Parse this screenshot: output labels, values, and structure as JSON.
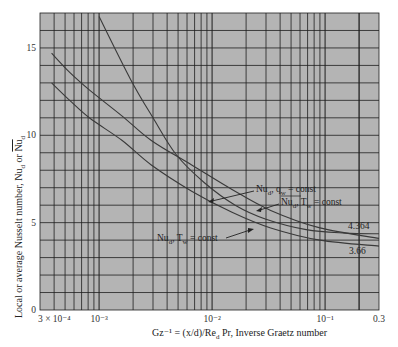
{
  "chart_data": {
    "type": "line",
    "title": "",
    "xlabel": "Gz⁻¹ = (x/d)/Re_d Pr, Inverse Graetz number",
    "ylabel": "Local or average Nusselt number, Nu_d or N̄u_d",
    "xscale": "log",
    "xlim": [
      0.0003,
      0.3
    ],
    "ylim": [
      0,
      17
    ],
    "grid": true,
    "x_tick_labels": [
      "3 × 10⁻⁴",
      "10⁻³",
      "10⁻²",
      "10⁻¹",
      "0.3"
    ],
    "x_ticks": [
      0.0003,
      0.001,
      0.01,
      0.1,
      0.3
    ],
    "y_tick_labels": [
      "0",
      "5",
      "10",
      "15"
    ],
    "y_ticks": [
      0,
      5,
      10,
      15
    ],
    "series": [
      {
        "name": "Nu_d, q_w = const",
        "x": [
          0.001,
          0.0019,
          0.003,
          0.0048,
          0.0085,
          0.016,
          0.03,
          0.068,
          0.15,
          0.3
        ],
        "y": [
          16.8,
          13.2,
          11.0,
          8.9,
          7.3,
          6.0,
          5.2,
          4.6,
          4.4,
          4.36
        ]
      },
      {
        "name": "N̄u_d, T_w = const",
        "x": [
          0.00038,
          0.00055,
          0.00082,
          0.0016,
          0.0029,
          0.0066,
          0.015,
          0.033,
          0.09,
          0.3
        ],
        "y": [
          14.7,
          13.6,
          12.6,
          11.1,
          9.7,
          8.3,
          6.9,
          5.7,
          4.7,
          4.1
        ]
      },
      {
        "name": "Nu_d, T_w = const",
        "x": [
          0.00038,
          0.00055,
          0.00082,
          0.0016,
          0.0029,
          0.0066,
          0.015,
          0.033,
          0.09,
          0.3
        ],
        "y": [
          13.0,
          12.0,
          11.0,
          9.7,
          8.3,
          6.8,
          5.6,
          4.7,
          4.0,
          3.66
        ]
      }
    ],
    "annotations": [
      {
        "text": "4.364",
        "x": 0.3,
        "y": 4.364
      },
      {
        "text": "3.66",
        "x": 0.3,
        "y": 3.66
      }
    ],
    "legend": "inline arrow labels"
  },
  "labels": {
    "series_1": {
      "main": "Nu",
      "sub": "d",
      "rest": ", q",
      "sub2": "w",
      "tail": " = const"
    },
    "series_2": {
      "main": "Nu",
      "sub": "d",
      "rest": ", T",
      "sub2": "w",
      "tail": " = const"
    },
    "series_3": {
      "main": "Nu",
      "sub": "d",
      "rest": ", T",
      "sub2": "w",
      "tail": " = const"
    },
    "asymptote_upper": "4.364",
    "asymptote_lower": "3.66",
    "x_axis_title": "Gz⁻¹ = (x/d)/Re",
    "x_axis_title_sub": "d",
    "x_axis_title_tail": " Pr, Inverse Graetz number",
    "y_axis_title": "Local or average Nusselt number, Nu",
    "y_axis_title_sub": "d",
    "y_axis_title_or": " or ",
    "y_axis_title_avg": "Nu",
    "y_axis_title_avg_sub": "d"
  },
  "colors": {
    "plot_bg": "#b4b4b4",
    "grid": "#1e1e1e",
    "curve": "#3a3a3a",
    "page_bg": "#ffffff"
  }
}
